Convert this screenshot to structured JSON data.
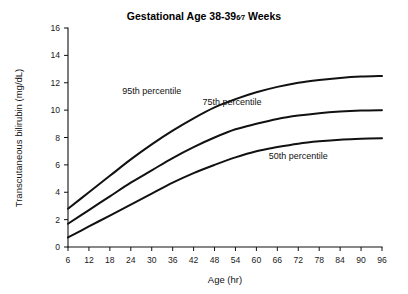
{
  "chart_data": {
    "type": "line",
    "title_prefix": "Gestational Age 38-39",
    "title_fraction_numerator": "6",
    "title_fraction_denominator": "7",
    "title_suffix": "Weeks",
    "xlabel": "Age (hr)",
    "ylabel": "Transcutaneous bilirubin (mg/dL)",
    "xlim": [
      6,
      96
    ],
    "ylim": [
      0,
      16
    ],
    "xticks": [
      6,
      12,
      18,
      24,
      30,
      36,
      42,
      48,
      54,
      60,
      66,
      72,
      78,
      84,
      90,
      96
    ],
    "yticks": [
      0,
      2,
      4,
      6,
      8,
      10,
      12,
      14,
      16
    ],
    "grid": false,
    "legend": "inline-labels",
    "x": [
      6,
      12,
      18,
      24,
      30,
      36,
      42,
      48,
      54,
      60,
      66,
      72,
      78,
      84,
      90,
      96
    ],
    "series": [
      {
        "name": "95th percentile",
        "label": "95th percentile",
        "label_x": 30,
        "label_y": 11.2,
        "values": [
          2.8,
          4.0,
          5.2,
          6.4,
          7.5,
          8.5,
          9.4,
          10.2,
          10.8,
          11.3,
          11.7,
          12.0,
          12.2,
          12.35,
          12.45,
          12.5
        ]
      },
      {
        "name": "75th percentile",
        "label": "75th percentile",
        "label_x": 53,
        "label_y": 10.4,
        "values": [
          1.7,
          2.7,
          3.7,
          4.7,
          5.6,
          6.5,
          7.3,
          8.0,
          8.6,
          9.0,
          9.35,
          9.6,
          9.78,
          9.9,
          9.97,
          10.0
        ]
      },
      {
        "name": "50th percentile",
        "label": "50th percentile",
        "label_x": 72,
        "label_y": 6.4,
        "values": [
          0.7,
          1.5,
          2.3,
          3.1,
          3.9,
          4.7,
          5.4,
          6.0,
          6.55,
          7.0,
          7.3,
          7.55,
          7.72,
          7.84,
          7.9,
          7.95
        ]
      }
    ],
    "colors": {
      "curve": "#111111",
      "axis": "#111111",
      "background": "#ffffff"
    }
  }
}
